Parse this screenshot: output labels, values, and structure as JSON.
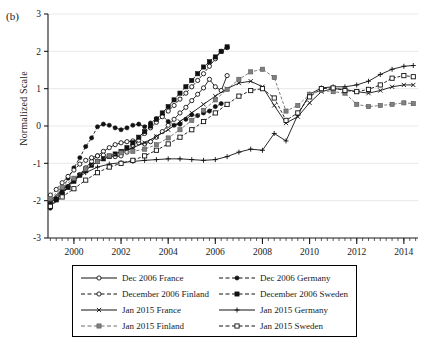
{
  "panel": {
    "label": "(b)"
  },
  "axes": {
    "ylabel": "Normalized Scale",
    "xlabel": "",
    "yticks": [
      "-3",
      "-2",
      "-1",
      "0",
      "1",
      "2",
      "3"
    ],
    "xticks": [
      "2000",
      "2002",
      "2004",
      "2006",
      "2008",
      "2010",
      "2012",
      "2014"
    ]
  },
  "legend": {
    "rows": [
      {
        "left": {
          "label": "Dec 2006 France",
          "key": "open-circle-solid-line"
        },
        "right": {
          "label": "Dec 2006 Germany",
          "key": "filled-circle-dashed-line"
        }
      },
      {
        "left": {
          "label": "December 2006 Finland",
          "key": "open-circle-dashed-line"
        },
        "right": {
          "label": "December 2006 Sweden",
          "key": "filled-square-dashed-line"
        }
      },
      {
        "left": {
          "label": "Jan 2015 France",
          "key": "cross-x-solid-line"
        },
        "right": {
          "label": "Jan 2015 Germany",
          "key": "plus-solid-line"
        }
      },
      {
        "left": {
          "label": "Jan 2015 Finland",
          "key": "gray-square-dashed-line"
        },
        "right": {
          "label": "Jan 2015 Sweden",
          "key": "open-square-dashed-line"
        }
      }
    ]
  },
  "colors": {
    "axis": "#1a1a1a",
    "grid": "#e8e8e8",
    "black": "#111111",
    "gray_marker": "#808080",
    "background": "#ffffff"
  },
  "chart_data": {
    "type": "line",
    "title": "",
    "xlabel": "",
    "ylabel": "Normalized Scale",
    "xlim": [
      1998.9,
      2014.6
    ],
    "ylim": [
      -3,
      3
    ],
    "grid": true,
    "legend_position": "below",
    "xticks": [
      2000,
      2002,
      2004,
      2006,
      2008,
      2010,
      2012,
      2014
    ],
    "yticks": [
      -3,
      -2,
      -1,
      0,
      1,
      2,
      3
    ],
    "series": [
      {
        "name": "Dec 2006 France",
        "marker": "open-circle",
        "line": "solid",
        "color": "#111111",
        "x": [
          1999.0,
          1999.25,
          1999.5,
          1999.75,
          2000.0,
          2000.25,
          2000.5,
          2000.75,
          2001.0,
          2001.25,
          2001.5,
          2001.75,
          2002.0,
          2002.25,
          2002.5,
          2002.75,
          2003.0,
          2003.25,
          2003.5,
          2003.75,
          2004.0,
          2004.25,
          2004.5,
          2004.75,
          2005.0,
          2005.25,
          2005.5,
          2005.75,
          2006.0,
          2006.25,
          2006.5
        ],
        "y": [
          -2.05,
          -1.95,
          -1.8,
          -1.62,
          -1.45,
          -1.3,
          -1.12,
          -0.95,
          -0.8,
          -0.68,
          -0.58,
          -0.5,
          -0.45,
          -0.42,
          -0.4,
          -0.45,
          -0.48,
          -0.42,
          -0.3,
          -0.15,
          0.02,
          0.18,
          0.35,
          0.5,
          0.68,
          0.85,
          1.02,
          1.25,
          1.05,
          0.95,
          1.35
        ]
      },
      {
        "name": "Dec 2006 Germany",
        "marker": "filled-circle",
        "line": "dashed",
        "color": "#111111",
        "x": [
          1999.0,
          1999.25,
          1999.5,
          1999.75,
          2000.0,
          2000.25,
          2000.5,
          2000.75,
          2001.0,
          2001.25,
          2001.5,
          2001.75,
          2002.0,
          2002.25,
          2002.5,
          2002.75,
          2003.0,
          2003.25,
          2003.5,
          2003.75,
          2004.0,
          2004.25,
          2004.5,
          2004.75,
          2005.0,
          2005.25,
          2005.5,
          2005.75,
          2006.0,
          2006.25
        ],
        "y": [
          -2.2,
          -1.95,
          -1.7,
          -1.4,
          -1.12,
          -0.85,
          -0.55,
          -0.32,
          -0.02,
          0.05,
          0.02,
          -0.05,
          -0.1,
          -0.05,
          0.02,
          0.05,
          -0.02,
          0.08,
          0.2,
          0.28,
          0.12,
          0.02,
          0.05,
          0.18,
          0.3,
          0.28,
          0.35,
          0.4,
          0.52,
          0.6
        ]
      },
      {
        "name": "December 2006 Finland",
        "marker": "open-circle",
        "line": "dashed",
        "color": "#111111",
        "x": [
          1999.0,
          1999.25,
          1999.5,
          1999.75,
          2000.0,
          2000.25,
          2000.5,
          2000.75,
          2001.0,
          2001.25,
          2001.5,
          2001.75,
          2002.0,
          2002.25,
          2002.5,
          2002.75,
          2003.0,
          2003.25,
          2003.5,
          2003.75,
          2004.0,
          2004.25,
          2004.5,
          2004.75,
          2005.0,
          2005.25,
          2005.5,
          2005.75,
          2006.0,
          2006.25,
          2006.5
        ],
        "y": [
          -1.85,
          -1.7,
          -1.52,
          -1.35,
          -1.18,
          -1.02,
          -0.92,
          -0.85,
          -0.8,
          -0.78,
          -0.8,
          -0.82,
          -0.8,
          -0.7,
          -0.55,
          -0.38,
          -0.2,
          -0.05,
          0.1,
          0.25,
          0.4,
          0.55,
          0.72,
          0.88,
          1.05,
          1.22,
          1.4,
          1.6,
          1.8,
          2.0,
          2.1
        ]
      },
      {
        "name": "December 2006 Sweden",
        "marker": "filled-square",
        "line": "dashed",
        "color": "#111111",
        "x": [
          1999.0,
          1999.25,
          1999.5,
          1999.75,
          2000.0,
          2000.25,
          2000.5,
          2000.75,
          2001.0,
          2001.25,
          2001.5,
          2001.75,
          2002.0,
          2002.25,
          2002.5,
          2002.75,
          2003.0,
          2003.25,
          2003.5,
          2003.75,
          2004.0,
          2004.25,
          2004.5,
          2004.75,
          2005.0,
          2005.25,
          2005.5,
          2005.75,
          2006.0,
          2006.25,
          2006.5
        ],
        "y": [
          -2.1,
          -1.98,
          -1.82,
          -1.65,
          -1.48,
          -1.32,
          -1.18,
          -1.05,
          -0.95,
          -0.88,
          -0.82,
          -0.75,
          -0.68,
          -0.58,
          -0.45,
          -0.3,
          -0.15,
          0.0,
          0.18,
          0.35,
          0.52,
          0.7,
          0.88,
          1.05,
          1.22,
          1.4,
          1.58,
          1.72,
          1.85,
          2.0,
          2.12
        ]
      },
      {
        "name": "Jan 2015 France",
        "marker": "cross-x",
        "line": "solid",
        "color": "#111111",
        "x": [
          1999.0,
          1999.5,
          2000.0,
          2000.5,
          2001.0,
          2001.5,
          2002.0,
          2002.5,
          2003.0,
          2003.5,
          2004.0,
          2004.5,
          2005.0,
          2005.5,
          2006.0,
          2006.5,
          2007.0,
          2007.5,
          2008.0,
          2008.5,
          2009.0,
          2009.5,
          2010.0,
          2010.5,
          2011.0,
          2011.5,
          2012.0,
          2012.5,
          2013.0,
          2013.5,
          2014.0,
          2014.4
        ],
        "y": [
          -2.05,
          -1.72,
          -1.45,
          -1.18,
          -0.95,
          -0.8,
          -0.7,
          -0.58,
          -0.45,
          -0.28,
          -0.1,
          0.12,
          0.35,
          0.58,
          0.8,
          1.0,
          1.15,
          1.2,
          1.05,
          0.55,
          0.08,
          0.25,
          0.62,
          0.92,
          1.0,
          0.98,
          0.92,
          0.88,
          0.95,
          1.05,
          1.1,
          1.1
        ]
      },
      {
        "name": "Jan 2015 Germany",
        "marker": "plus",
        "line": "solid",
        "color": "#111111",
        "x": [
          1999.0,
          1999.5,
          2000.0,
          2000.5,
          2001.0,
          2001.5,
          2002.0,
          2002.5,
          2003.0,
          2003.5,
          2004.0,
          2004.5,
          2005.0,
          2005.5,
          2006.0,
          2006.5,
          2007.0,
          2007.5,
          2008.0,
          2008.5,
          2009.0,
          2009.5,
          2010.0,
          2010.5,
          2011.0,
          2011.5,
          2012.0,
          2012.5,
          2013.0,
          2013.5,
          2014.0,
          2014.4
        ],
        "y": [
          -2.0,
          -1.7,
          -1.45,
          -1.25,
          -1.1,
          -1.02,
          -0.98,
          -0.95,
          -0.92,
          -0.9,
          -0.88,
          -0.88,
          -0.9,
          -0.92,
          -0.9,
          -0.82,
          -0.7,
          -0.62,
          -0.65,
          -0.2,
          -0.4,
          0.3,
          0.85,
          1.02,
          1.05,
          1.05,
          1.1,
          1.2,
          1.38,
          1.52,
          1.6,
          1.62
        ]
      },
      {
        "name": "Jan 2015 Finland",
        "marker": "gray-square",
        "line": "dashed",
        "color": "#808080",
        "x": [
          1999.0,
          1999.5,
          2000.0,
          2000.5,
          2001.0,
          2001.5,
          2002.0,
          2002.5,
          2003.0,
          2003.5,
          2004.0,
          2004.5,
          2005.0,
          2005.5,
          2006.0,
          2006.5,
          2007.0,
          2007.5,
          2008.0,
          2008.5,
          2009.0,
          2009.5,
          2010.0,
          2010.5,
          2011.0,
          2011.5,
          2012.0,
          2012.5,
          2013.0,
          2013.5,
          2014.0,
          2014.4
        ],
        "y": [
          -1.95,
          -1.65,
          -1.4,
          -1.15,
          -0.95,
          -0.8,
          -0.72,
          -0.68,
          -0.62,
          -0.5,
          -0.32,
          -0.1,
          0.15,
          0.42,
          0.7,
          0.98,
          1.25,
          1.45,
          1.52,
          1.3,
          0.4,
          0.55,
          0.85,
          0.95,
          0.92,
          0.88,
          0.58,
          0.52,
          0.55,
          0.58,
          0.62,
          0.6
        ]
      },
      {
        "name": "Jan 2015 Sweden",
        "marker": "open-square",
        "line": "dashed",
        "color": "#111111",
        "x": [
          1999.0,
          1999.5,
          2000.0,
          2000.5,
          2001.0,
          2001.5,
          2002.0,
          2002.5,
          2003.0,
          2003.5,
          2004.0,
          2004.5,
          2005.0,
          2005.5,
          2006.0,
          2006.5,
          2007.0,
          2007.5,
          2008.0,
          2008.5,
          2009.0,
          2009.5,
          2010.0,
          2010.5,
          2011.0,
          2011.5,
          2012.0,
          2012.5,
          2013.0,
          2013.5,
          2014.0,
          2014.4
        ],
        "y": [
          -2.15,
          -1.9,
          -1.68,
          -1.45,
          -1.25,
          -1.1,
          -1.0,
          -0.92,
          -0.8,
          -0.65,
          -0.48,
          -0.3,
          -0.1,
          0.12,
          0.35,
          0.58,
          0.8,
          0.95,
          1.0,
          0.75,
          0.15,
          0.35,
          0.78,
          1.0,
          1.02,
          0.95,
          0.92,
          0.98,
          1.1,
          1.28,
          1.35,
          1.32
        ]
      }
    ]
  }
}
